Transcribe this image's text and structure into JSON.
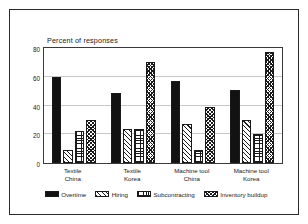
{
  "chart_data": {
    "type": "bar",
    "title": "Percent of responses",
    "xlabel": "",
    "ylabel": "",
    "ylim": [
      0,
      80
    ],
    "yticks": [
      0,
      20,
      40,
      60,
      80
    ],
    "grid": true,
    "legend_position": "bottom",
    "categories": [
      "Textile China",
      "Textile Korea",
      "Machine tool China",
      "Machine tool Korea"
    ],
    "category_lines": [
      {
        "line1": "Textile",
        "line2": "China"
      },
      {
        "line1": "Textile",
        "line2": "Korea"
      },
      {
        "line1": "Machine tool",
        "line2": "China"
      },
      {
        "line1": "Machine tool",
        "line2": "Korea"
      }
    ],
    "series": [
      {
        "name": "Overtime",
        "pattern": "solid-black",
        "values": [
          60,
          49,
          57,
          51
        ]
      },
      {
        "name": "Hiring",
        "pattern": "diagonal-hatch",
        "values": [
          9,
          24,
          27,
          30
        ]
      },
      {
        "name": "Subcontracting",
        "pattern": "grid-crosshatch",
        "values": [
          22,
          24,
          9,
          20
        ]
      },
      {
        "name": "Inventory buildup",
        "pattern": "diagonal-crosshatch",
        "values": [
          30,
          70,
          39,
          77
        ]
      }
    ]
  },
  "axis": {
    "ytick_labels": [
      "80",
      "60",
      "40",
      "20",
      "0"
    ]
  },
  "colors": {
    "frame": "#2b2b2b",
    "axis": "#3a3a3a",
    "grid": "#c8c8c8",
    "ink": "#1a1a1a",
    "background": "#ffffff",
    "bar_fill_solid": "#121212"
  }
}
